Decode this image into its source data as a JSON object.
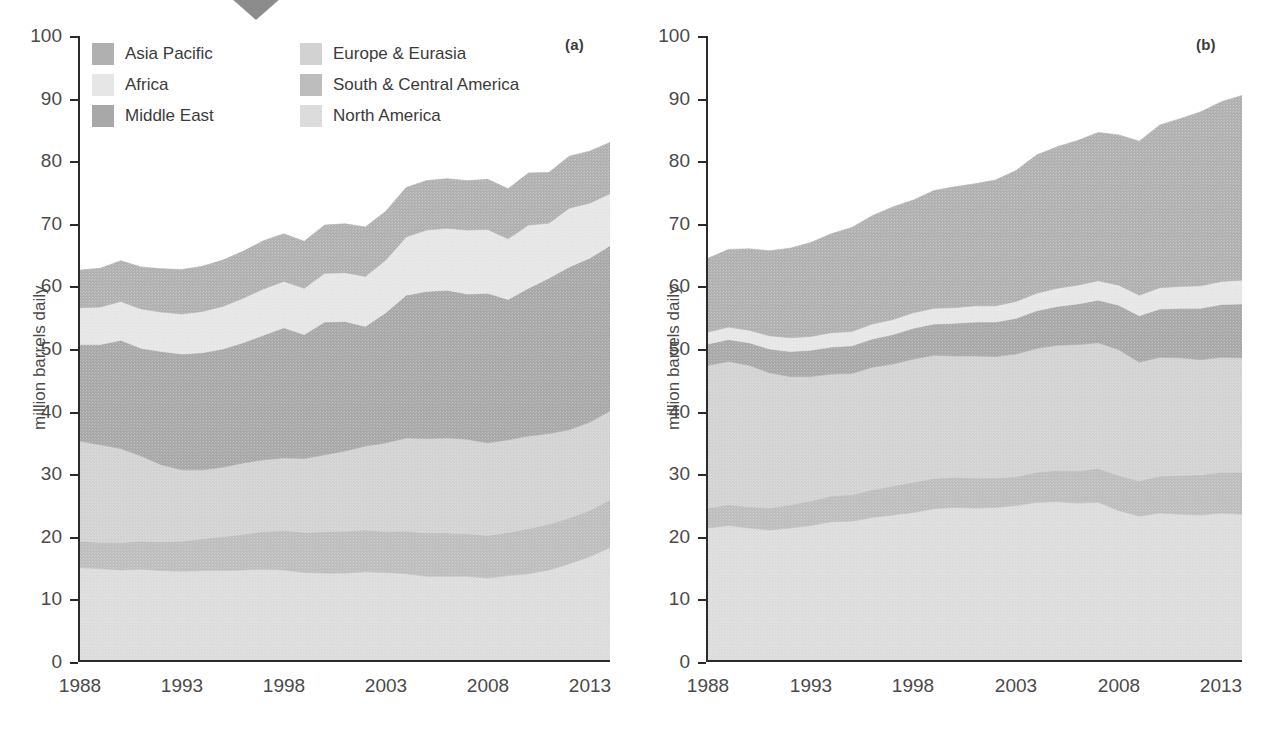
{
  "figure": {
    "marker_icon": "down-triangle-marker",
    "marker_color": "#8c8c8c",
    "background": "#ffffff"
  },
  "panels": [
    {
      "id": "a",
      "tag": "(a)"
    },
    {
      "id": "b",
      "tag": "(b)"
    }
  ],
  "axes": {
    "ylabel": "million barrels daily",
    "yticks": [
      "0",
      "10",
      "20",
      "30",
      "40",
      "50",
      "60",
      "70",
      "80",
      "90",
      "100"
    ],
    "ytick_values": [
      0,
      10,
      20,
      30,
      40,
      50,
      60,
      70,
      80,
      90,
      100
    ],
    "xticks": [
      "1988",
      "1993",
      "1998",
      "2003",
      "2008",
      "2013"
    ],
    "xtick_values": [
      1988,
      1993,
      1998,
      2003,
      2008,
      2013
    ],
    "ylim": [
      0,
      100
    ],
    "xlim": [
      1988,
      2014
    ],
    "grid": false
  },
  "legend": {
    "position": "top-left-inside-panel-a",
    "columns": [
      {
        "items": [
          {
            "label": "Asia Pacific",
            "color": "#b0b0b0"
          },
          {
            "label": "Africa",
            "color": "#e6e6e6"
          },
          {
            "label": "Middle East",
            "color": "#a8a8a8"
          }
        ]
      },
      {
        "items": [
          {
            "label": "Europe & Eurasia",
            "color": "#d2d2d2"
          },
          {
            "label": "South & Central America",
            "color": "#bdbdbd"
          },
          {
            "label": "North America",
            "color": "#dcdcdc"
          }
        ]
      }
    ]
  },
  "chart_data": [
    {
      "id": "a",
      "type": "area",
      "stacked": true,
      "title": "",
      "subtitle": "(a)",
      "xlabel": "",
      "ylabel": "million barrels daily",
      "xlim": [
        1988,
        2014
      ],
      "ylim": [
        0,
        100
      ],
      "grid": false,
      "legend_position": "top-left",
      "x": [
        1988,
        1989,
        1990,
        1991,
        1992,
        1993,
        1994,
        1995,
        1996,
        1997,
        1998,
        1999,
        2000,
        2001,
        2002,
        2003,
        2004,
        2005,
        2006,
        2007,
        2008,
        2009,
        2010,
        2011,
        2012,
        2013,
        2014
      ],
      "series": [
        {
          "name": "North America",
          "color": "#dcdcdc",
          "values": [
            15.1,
            14.9,
            14.7,
            14.8,
            14.6,
            14.5,
            14.6,
            14.6,
            14.7,
            14.8,
            14.7,
            14.3,
            14.2,
            14.2,
            14.4,
            14.3,
            14.1,
            13.7,
            13.7,
            13.7,
            13.4,
            13.8,
            14.1,
            14.7,
            15.7,
            16.8,
            18.3
          ]
        },
        {
          "name": "South & Central America",
          "color": "#bdbdbd",
          "values": [
            4.2,
            4.2,
            4.4,
            4.5,
            4.6,
            4.8,
            5.1,
            5.4,
            5.7,
            6.0,
            6.3,
            6.4,
            6.6,
            6.7,
            6.7,
            6.5,
            6.8,
            6.9,
            6.9,
            6.8,
            6.8,
            6.9,
            7.2,
            7.3,
            7.3,
            7.4,
            7.6
          ]
        },
        {
          "name": "Europe & Eurasia",
          "color": "#d2d2d2",
          "values": [
            16.0,
            15.6,
            15.0,
            13.6,
            12.3,
            11.4,
            11.0,
            11.1,
            11.4,
            11.5,
            11.6,
            11.8,
            12.3,
            12.8,
            13.4,
            14.2,
            14.9,
            15.1,
            15.2,
            15.1,
            14.8,
            14.8,
            14.8,
            14.5,
            14.1,
            14.1,
            14.2
          ]
        },
        {
          "name": "Middle East",
          "color": "#a8a8a8",
          "values": [
            15.4,
            16.0,
            17.3,
            17.2,
            18.1,
            18.5,
            18.7,
            18.9,
            19.2,
            19.9,
            20.8,
            19.8,
            21.2,
            20.7,
            19.1,
            20.8,
            22.8,
            23.5,
            23.6,
            23.2,
            23.9,
            22.4,
            23.6,
            24.8,
            26.0,
            26.2,
            26.4
          ]
        },
        {
          "name": "Africa",
          "color": "#e6e6e6",
          "values": [
            5.9,
            6.0,
            6.2,
            6.3,
            6.3,
            6.4,
            6.6,
            6.8,
            7.1,
            7.4,
            7.4,
            7.4,
            7.8,
            7.8,
            8.0,
            8.4,
            9.3,
            9.8,
            9.9,
            10.2,
            10.2,
            9.7,
            10.1,
            8.8,
            9.4,
            8.8,
            8.3
          ]
        },
        {
          "name": "Asia Pacific",
          "color": "#b0b0b0",
          "values": [
            6.0,
            6.2,
            6.5,
            6.7,
            6.9,
            7.1,
            7.2,
            7.4,
            7.5,
            7.7,
            7.6,
            7.5,
            7.7,
            7.8,
            7.9,
            7.8,
            7.9,
            7.9,
            7.9,
            7.9,
            8.0,
            8.0,
            8.3,
            8.1,
            8.3,
            8.3,
            8.2
          ]
        }
      ],
      "totals": [
        62.6,
        62.9,
        64.1,
        63.1,
        62.8,
        62.7,
        63.2,
        64.2,
        65.6,
        67.3,
        68.4,
        67.2,
        69.8,
        70.0,
        69.5,
        72.0,
        75.8,
        76.9,
        77.2,
        76.9,
        77.1,
        75.6,
        78.1,
        78.2,
        80.8,
        81.6,
        83.0
      ]
    },
    {
      "id": "b",
      "type": "area",
      "stacked": true,
      "title": "",
      "subtitle": "(b)",
      "xlabel": "",
      "ylabel": "million barrels daily",
      "xlim": [
        1988,
        2014
      ],
      "ylim": [
        0,
        100
      ],
      "grid": false,
      "legend_position": "none",
      "x": [
        1988,
        1989,
        1990,
        1991,
        1992,
        1993,
        1994,
        1995,
        1996,
        1997,
        1998,
        1999,
        2000,
        2001,
        2002,
        2003,
        2004,
        2005,
        2006,
        2007,
        2008,
        2009,
        2010,
        2011,
        2012,
        2013,
        2014
      ],
      "series": [
        {
          "name": "North America",
          "color": "#dcdcdc",
          "values": [
            21.4,
            21.8,
            21.4,
            21.1,
            21.4,
            21.8,
            22.4,
            22.5,
            23.1,
            23.5,
            23.9,
            24.5,
            24.7,
            24.6,
            24.7,
            25.0,
            25.5,
            25.6,
            25.4,
            25.5,
            24.2,
            23.3,
            23.8,
            23.6,
            23.5,
            23.8,
            23.6
          ]
        },
        {
          "name": "South & Central America",
          "color": "#bdbdbd",
          "values": [
            3.2,
            3.3,
            3.4,
            3.5,
            3.7,
            3.9,
            4.1,
            4.2,
            4.4,
            4.6,
            4.8,
            4.8,
            4.8,
            4.8,
            4.7,
            4.6,
            4.8,
            5.0,
            5.1,
            5.4,
            5.6,
            5.6,
            5.9,
            6.2,
            6.4,
            6.5,
            6.7
          ]
        },
        {
          "name": "Europe & Eurasia",
          "color": "#d2d2d2",
          "values": [
            22.8,
            22.9,
            22.6,
            21.6,
            20.5,
            19.9,
            19.5,
            19.4,
            19.6,
            19.5,
            19.7,
            19.7,
            19.4,
            19.5,
            19.4,
            19.6,
            19.8,
            20.0,
            20.2,
            20.1,
            20.1,
            19.0,
            19.0,
            18.8,
            18.4,
            18.4,
            18.3
          ]
        },
        {
          "name": "Middle East",
          "color": "#a8a8a8",
          "values": [
            3.4,
            3.5,
            3.6,
            3.8,
            4.0,
            4.2,
            4.3,
            4.4,
            4.5,
            4.7,
            4.9,
            5.0,
            5.2,
            5.4,
            5.5,
            5.7,
            6.0,
            6.2,
            6.5,
            6.8,
            7.1,
            7.4,
            7.7,
            7.9,
            8.2,
            8.4,
            8.6
          ]
        },
        {
          "name": "Africa",
          "color": "#e6e6e6",
          "values": [
            1.9,
            2.0,
            2.0,
            2.1,
            2.2,
            2.2,
            2.3,
            2.3,
            2.4,
            2.4,
            2.5,
            2.5,
            2.5,
            2.6,
            2.6,
            2.7,
            2.8,
            2.9,
            3.0,
            3.1,
            3.2,
            3.3,
            3.4,
            3.5,
            3.6,
            3.7,
            3.8
          ]
        },
        {
          "name": "Asia Pacific",
          "color": "#b0b0b0",
          "values": [
            11.8,
            12.4,
            13.0,
            13.6,
            14.3,
            15.0,
            15.8,
            16.6,
            17.3,
            18.0,
            18.0,
            18.8,
            19.3,
            19.5,
            20.1,
            20.9,
            22.1,
            22.6,
            23.1,
            23.7,
            24.0,
            24.6,
            26.0,
            26.8,
            27.8,
            28.7,
            29.5
          ]
        }
      ],
      "totals": [
        64.5,
        65.9,
        66.0,
        65.7,
        66.1,
        67.0,
        68.4,
        69.4,
        71.3,
        72.7,
        73.8,
        75.3,
        75.9,
        76.4,
        77.0,
        78.5,
        81.0,
        82.3,
        83.3,
        84.6,
        84.2,
        83.2,
        85.8,
        86.8,
        87.9,
        89.5,
        90.5
      ]
    }
  ]
}
